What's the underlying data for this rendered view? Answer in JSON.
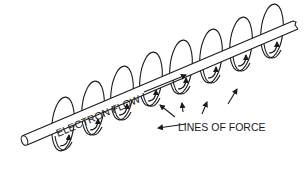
{
  "diagram": {
    "labels": {
      "wire_label": "ELECTRON FLOW",
      "field_label": "LINES OF FORCE"
    },
    "colors": {
      "ink": "#1a1a1a",
      "background": "#ffffff"
    },
    "rings": [
      {
        "cx": 63,
        "cy": 124
      },
      {
        "cx": 93,
        "cy": 108
      },
      {
        "cx": 122,
        "cy": 93
      },
      {
        "cx": 151,
        "cy": 79
      },
      {
        "cx": 181,
        "cy": 67
      },
      {
        "cx": 211,
        "cy": 56
      },
      {
        "cx": 241,
        "cy": 44
      },
      {
        "cx": 272,
        "cy": 31
      }
    ]
  }
}
